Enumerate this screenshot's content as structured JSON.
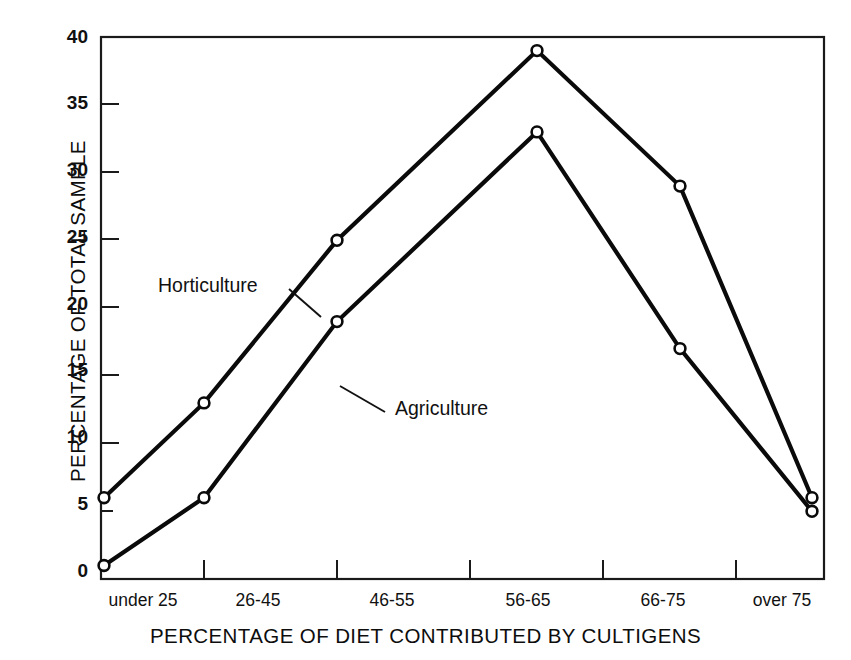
{
  "chart_data": {
    "type": "line",
    "title": "",
    "xlabel": "PERCENTAGE OF DIET CONTRIBUTED BY CULTIGENS",
    "ylabel": "PERCENTAGE OF TOTAL SAMPLE",
    "categories": [
      "under 25",
      "26-45",
      "46-55",
      "56-65",
      "66-75",
      "over 75"
    ],
    "ylim": [
      0,
      40
    ],
    "yticks": [
      0,
      5,
      10,
      15,
      20,
      25,
      30,
      35,
      40
    ],
    "ytick_labels": [
      "0",
      "5",
      "10",
      "15",
      "20",
      "25",
      "30",
      "35",
      "40"
    ],
    "grid": false,
    "legend_position": "inline-annotations",
    "marker": "open-circle",
    "series": [
      {
        "name": "Horticulture",
        "values": [
          6,
          13,
          25,
          39,
          29,
          6
        ]
      },
      {
        "name": "Agriculture",
        "values": [
          1,
          6,
          19,
          33,
          17,
          5
        ]
      }
    ],
    "annotations": [
      {
        "text": "Horticulture",
        "points_to": "upper-line"
      },
      {
        "text": "Agriculture",
        "points_to": "lower-line"
      }
    ],
    "colors": {
      "line": "#0a0a0a",
      "marker_fill": "#ffffff",
      "frame": "#1a1a1a",
      "background": "#ffffff"
    }
  }
}
